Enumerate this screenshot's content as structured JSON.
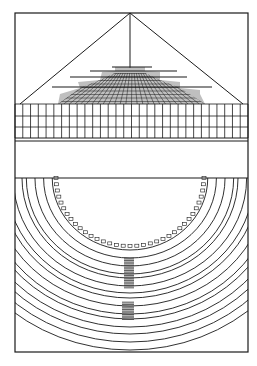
{
  "illustration": {
    "subject": "theater plan and perspective engraving",
    "ink_color": "#1a1a1a",
    "paper_color": "#ffffff",
    "frame": {
      "left": 15,
      "top": 13,
      "right": 248,
      "bottom": 352
    },
    "upper_section": {
      "label": "perspective stage with pyramid sightlines",
      "apex": [
        130,
        13
      ],
      "grid_band": {
        "top": 104,
        "bottom": 139,
        "rows": 3,
        "columns": 30
      }
    },
    "middle_band": {
      "top": 140,
      "bottom": 178
    },
    "lower_section": {
      "label": "semicircular auditorium plan",
      "center": [
        130,
        178
      ],
      "inner_radius": 72,
      "ring_count": 12,
      "stairs": [
        {
          "y_top": 258,
          "y_bottom": 288
        },
        {
          "y_top": 302,
          "y_bottom": 318
        }
      ]
    }
  }
}
